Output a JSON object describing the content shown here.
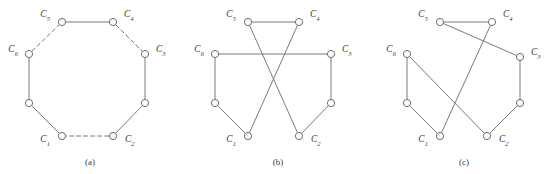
{
  "figure": {
    "width": 556,
    "height": 174,
    "background": "#ffffff",
    "edge_color": "#7a7a7a",
    "node_fill": "#ffffff",
    "node_stroke": "#6f6f6f",
    "label_color": "#3a3a3a",
    "node_radius": 3.6
  },
  "panels": [
    {
      "id": "a",
      "caption": "(a)",
      "caption_x": 90,
      "caption_y": 165,
      "origin_x": 0,
      "nodes": [
        {
          "id": "n1",
          "label": "C",
          "sub": "5",
          "x": 62,
          "y": 22,
          "lx": 50,
          "ly": 17,
          "anchor": "end"
        },
        {
          "id": "n2",
          "label": "C",
          "sub": "4",
          "x": 113,
          "y": 22,
          "lx": 124,
          "ly": 17,
          "anchor": "start"
        },
        {
          "id": "n3",
          "label": "C",
          "sub": "3",
          "x": 145,
          "y": 54,
          "lx": 156,
          "ly": 52,
          "anchor": "start"
        },
        {
          "id": "n4",
          "label": "",
          "sub": "",
          "x": 145,
          "y": 103,
          "lx": 0,
          "ly": 0,
          "anchor": "start"
        },
        {
          "id": "n5",
          "label": "C",
          "sub": "2",
          "x": 113,
          "y": 136,
          "lx": 125,
          "ly": 142,
          "anchor": "start"
        },
        {
          "id": "n6",
          "label": "C",
          "sub": "1",
          "x": 62,
          "y": 136,
          "lx": 50,
          "ly": 142,
          "anchor": "end"
        },
        {
          "id": "n7",
          "label": "",
          "sub": "",
          "x": 29,
          "y": 103,
          "lx": 0,
          "ly": 0,
          "anchor": "start"
        },
        {
          "id": "n8",
          "label": "C",
          "sub": "6",
          "x": 29,
          "y": 54,
          "lx": 18,
          "ly": 52,
          "anchor": "end"
        }
      ],
      "edges": [
        {
          "from": "n1",
          "to": "n2",
          "style": "solid"
        },
        {
          "from": "n2",
          "to": "n3",
          "style": "dashed"
        },
        {
          "from": "n3",
          "to": "n4",
          "style": "solid"
        },
        {
          "from": "n4",
          "to": "n5",
          "style": "solid"
        },
        {
          "from": "n5",
          "to": "n6",
          "style": "dashed"
        },
        {
          "from": "n6",
          "to": "n7",
          "style": "solid"
        },
        {
          "from": "n7",
          "to": "n8",
          "style": "solid"
        },
        {
          "from": "n8",
          "to": "n1",
          "style": "dashed"
        }
      ]
    },
    {
      "id": "b",
      "caption": "(b)",
      "caption_x": 278,
      "caption_y": 165,
      "origin_x": 0,
      "nodes": [
        {
          "id": "n1",
          "label": "C",
          "sub": "5",
          "x": 248,
          "y": 22,
          "lx": 236,
          "ly": 17,
          "anchor": "end"
        },
        {
          "id": "n2",
          "label": "C",
          "sub": "4",
          "x": 299,
          "y": 22,
          "lx": 310,
          "ly": 17,
          "anchor": "start"
        },
        {
          "id": "n3",
          "label": "C",
          "sub": "3",
          "x": 331,
          "y": 54,
          "lx": 342,
          "ly": 52,
          "anchor": "start"
        },
        {
          "id": "n4",
          "label": "",
          "sub": "",
          "x": 331,
          "y": 103,
          "lx": 0,
          "ly": 0,
          "anchor": "start"
        },
        {
          "id": "n5",
          "label": "C",
          "sub": "2",
          "x": 299,
          "y": 136,
          "lx": 311,
          "ly": 142,
          "anchor": "start"
        },
        {
          "id": "n6",
          "label": "C",
          "sub": "1",
          "x": 248,
          "y": 136,
          "lx": 236,
          "ly": 142,
          "anchor": "end"
        },
        {
          "id": "n7",
          "label": "",
          "sub": "",
          "x": 215,
          "y": 103,
          "lx": 0,
          "ly": 0,
          "anchor": "start"
        },
        {
          "id": "n8",
          "label": "C",
          "sub": "6",
          "x": 215,
          "y": 54,
          "lx": 204,
          "ly": 52,
          "anchor": "end"
        }
      ],
      "edges": [
        {
          "from": "n1",
          "to": "n2",
          "style": "solid"
        },
        {
          "from": "n1",
          "to": "n5",
          "style": "solid"
        },
        {
          "from": "n2",
          "to": "n6",
          "style": "solid"
        },
        {
          "from": "n8",
          "to": "n3",
          "style": "solid"
        },
        {
          "from": "n3",
          "to": "n4",
          "style": "solid"
        },
        {
          "from": "n4",
          "to": "n5",
          "style": "solid"
        },
        {
          "from": "n6",
          "to": "n7",
          "style": "solid"
        },
        {
          "from": "n7",
          "to": "n8",
          "style": "solid"
        }
      ]
    },
    {
      "id": "c",
      "caption": "(c)",
      "caption_x": 464,
      "caption_y": 165,
      "origin_x": 0,
      "nodes": [
        {
          "id": "n1",
          "label": "C",
          "sub": "5",
          "x": 440,
          "y": 22,
          "lx": 428,
          "ly": 17,
          "anchor": "end"
        },
        {
          "id": "n2",
          "label": "C",
          "sub": "4",
          "x": 492,
          "y": 22,
          "lx": 503,
          "ly": 17,
          "anchor": "start"
        },
        {
          "id": "n3",
          "label": "C",
          "sub": "3",
          "x": 520,
          "y": 57,
          "lx": 531,
          "ly": 55,
          "anchor": "start"
        },
        {
          "id": "n4",
          "label": "",
          "sub": "",
          "x": 520,
          "y": 103,
          "lx": 0,
          "ly": 0,
          "anchor": "start"
        },
        {
          "id": "n5",
          "label": "C",
          "sub": "2",
          "x": 487,
          "y": 136,
          "lx": 499,
          "ly": 142,
          "anchor": "start"
        },
        {
          "id": "n6",
          "label": "C",
          "sub": "1",
          "x": 440,
          "y": 136,
          "lx": 428,
          "ly": 142,
          "anchor": "end"
        },
        {
          "id": "n7",
          "label": "",
          "sub": "",
          "x": 407,
          "y": 103,
          "lx": 0,
          "ly": 0,
          "anchor": "start"
        },
        {
          "id": "n8",
          "label": "C",
          "sub": "6",
          "x": 407,
          "y": 54,
          "lx": 396,
          "ly": 52,
          "anchor": "end"
        }
      ],
      "edges": [
        {
          "from": "n1",
          "to": "n2",
          "style": "solid"
        },
        {
          "from": "n1",
          "to": "n3",
          "style": "solid"
        },
        {
          "from": "n2",
          "to": "n6",
          "style": "solid"
        },
        {
          "from": "n8",
          "to": "n5",
          "style": "solid"
        },
        {
          "from": "n8",
          "to": "n7",
          "style": "solid"
        },
        {
          "from": "n3",
          "to": "n4",
          "style": "solid"
        },
        {
          "from": "n4",
          "to": "n5",
          "style": "solid"
        },
        {
          "from": "n6",
          "to": "n7",
          "style": "solid"
        }
      ]
    }
  ]
}
